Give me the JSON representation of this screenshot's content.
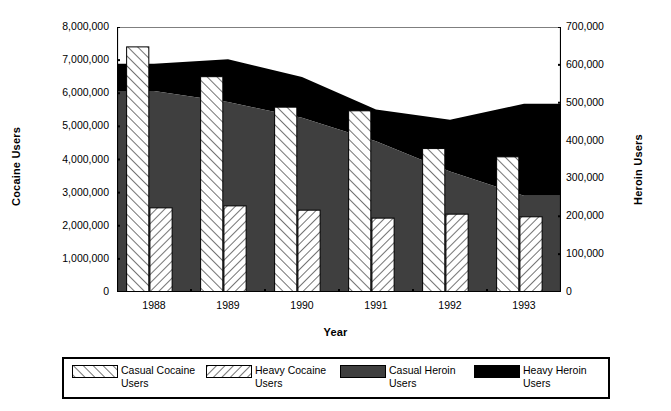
{
  "chart_data": {
    "type": "bar",
    "title": "",
    "xlabel": "Year",
    "ylabel": "Cocaine Users",
    "y2label": "Heroin Users",
    "categories": [
      "1988",
      "1989",
      "1990",
      "1991",
      "1992",
      "1993"
    ],
    "ylim": [
      0,
      8000000
    ],
    "y2lim": [
      0,
      700000
    ],
    "ytick_labels": [
      "8,000,000",
      "7,000,000",
      "6,000,000",
      "5,000,000",
      "4,000,000",
      "3,000,000",
      "2,000,000",
      "1,000,000",
      "0"
    ],
    "ytick_values": [
      8000000,
      7000000,
      6000000,
      5000000,
      4000000,
      3000000,
      2000000,
      1000000,
      0
    ],
    "y2tick_labels": [
      "700,000",
      "600,000",
      "500,000",
      "400,000",
      "300,000",
      "200,000",
      "100,000",
      "0"
    ],
    "y2tick_values": [
      700000,
      600000,
      500000,
      400000,
      300000,
      200000,
      100000,
      0
    ],
    "grid": false,
    "legend_position": "bottom",
    "series": [
      {
        "name": "Casual Cocaine Users",
        "render": "bar",
        "axis": "left",
        "fill": "hatch-backslash",
        "values": [
          7400000,
          6500000,
          5580000,
          5470000,
          4330000,
          4080000
        ]
      },
      {
        "name": "Heavy Cocaine Users",
        "render": "bar",
        "axis": "left",
        "fill": "hatch-forwardslash",
        "values": [
          2540000,
          2600000,
          2470000,
          2230000,
          2350000,
          2270000
        ]
      },
      {
        "name": "Casual Heroin Users",
        "render": "area",
        "axis": "right",
        "fill": "#3f3f3f",
        "values": [
          531000,
          502000,
          460000,
          398000,
          318000,
          254000
        ]
      },
      {
        "name": "Heavy Heroin Users",
        "render": "area-stacked",
        "axis": "right",
        "fill": "#000000",
        "values": [
          72000,
          113000,
          108000,
          84000,
          137000,
          243000
        ],
        "cumulative_top": [
          603000,
          615000,
          568000,
          482000,
          455000,
          497000
        ]
      }
    ]
  },
  "legend": {
    "items": [
      {
        "label_line1": "Casual Cocaine",
        "label_line2": "Users",
        "swatch": "hatch-backslash-swatch"
      },
      {
        "label_line1": "Heavy Cocaine",
        "label_line2": "Users",
        "swatch": "hatch-forwardslash-swatch"
      },
      {
        "label_line1": "Casual Heroin",
        "label_line2": "Users",
        "swatch": "gray-swatch"
      },
      {
        "label_line1": "Heavy Heroin",
        "label_line2": "Users",
        "swatch": "black-swatch"
      }
    ]
  },
  "colors": {
    "casual_heroin": "#3f3f3f",
    "heavy_heroin": "#000000",
    "axis": "#000000",
    "background": "#ffffff"
  }
}
